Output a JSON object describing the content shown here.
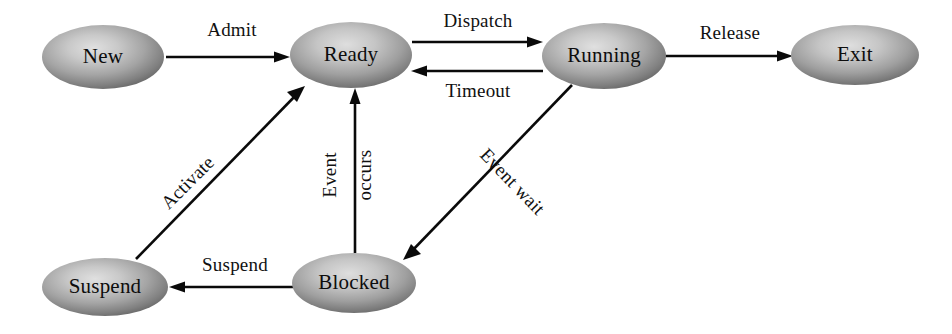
{
  "diagram": {
    "type": "state-transition-diagram",
    "background_color": "#ffffff",
    "node_fill_light": "#d2d2d2",
    "node_fill_mid": "#a6a6a6",
    "node_fill_dark": "#6b6b6b",
    "edge_color": "#0a0a0a",
    "text_color": "#0d0d0d"
  },
  "states": [
    {
      "id": "new",
      "label": "New",
      "cx": 103,
      "cy": 57,
      "rx": 61,
      "ry": 32
    },
    {
      "id": "ready",
      "label": "Ready",
      "cx": 351,
      "cy": 55,
      "rx": 61,
      "ry": 33
    },
    {
      "id": "running",
      "label": "Running",
      "cx": 604,
      "cy": 56,
      "rx": 62,
      "ry": 33
    },
    {
      "id": "exit",
      "label": "Exit",
      "cx": 855,
      "cy": 55,
      "rx": 64,
      "ry": 30
    },
    {
      "id": "suspend",
      "label": "Suspend",
      "cx": 105,
      "cy": 287,
      "rx": 63,
      "ry": 29
    },
    {
      "id": "blocked",
      "label": "Blocked",
      "cx": 354,
      "cy": 283,
      "rx": 62,
      "ry": 30
    }
  ],
  "transitions": [
    {
      "id": "admit",
      "label": "Admit",
      "from": "new",
      "to": "ready",
      "label_x": 232,
      "label_y": 36,
      "rotate": 0
    },
    {
      "id": "dispatch",
      "label": "Dispatch",
      "from": "ready",
      "to": "running",
      "label_x": 478,
      "label_y": 27,
      "rotate": 0
    },
    {
      "id": "timeout",
      "label": "Timeout",
      "from": "running",
      "to": "ready",
      "label_x": 478,
      "label_y": 97,
      "rotate": 0
    },
    {
      "id": "release",
      "label": "Release",
      "from": "running",
      "to": "exit",
      "label_x": 730,
      "label_y": 39,
      "rotate": 0
    },
    {
      "id": "event-wait",
      "label": "Event wait",
      "from": "running",
      "to": "blocked",
      "label_x": 508,
      "label_y": 186,
      "rotate": 46
    },
    {
      "id": "event-occurs-1",
      "label": "Event",
      "from": "blocked",
      "to": "ready",
      "label_x": 336,
      "label_y": 175,
      "rotate": -90
    },
    {
      "id": "event-occurs-2",
      "label": "occurs",
      "from": "blocked",
      "to": "ready",
      "label_x": 370,
      "label_y": 175,
      "rotate": -90
    },
    {
      "id": "suspend-edge",
      "label": "Suspend",
      "from": "blocked",
      "to": "suspend",
      "label_x": 235,
      "label_y": 271,
      "rotate": 0
    },
    {
      "id": "activate",
      "label": "Activate",
      "from": "suspend",
      "to": "ready",
      "label_x": 192,
      "label_y": 187,
      "rotate": -45
    }
  ],
  "legend": {
    "description": "Five-state process model with suspend state"
  }
}
